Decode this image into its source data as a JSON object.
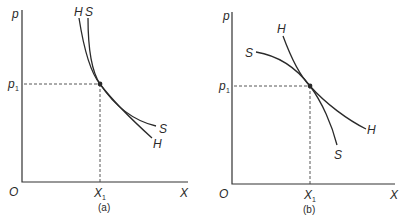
{
  "panels": [
    {
      "id": "a",
      "caption": "(a)",
      "y_axis_label": "p",
      "x_axis_label": "X",
      "origin_label": "O",
      "price_label": "p",
      "price_sub": "1",
      "quantity_label": "X",
      "quantity_sub": "1",
      "curves": [
        {
          "name": "H",
          "start_label": "H",
          "end_label": "H"
        },
        {
          "name": "S",
          "start_label": "S",
          "end_label": "S"
        }
      ]
    },
    {
      "id": "b",
      "caption": "(b)",
      "y_axis_label": "p",
      "x_axis_label": "X",
      "origin_label": "O",
      "price_label": "p",
      "price_sub": "1",
      "quantity_label": "X",
      "quantity_sub": "1",
      "curves": [
        {
          "name": "H",
          "start_label": "H",
          "end_label": "H"
        },
        {
          "name": "S",
          "start_label": "S",
          "end_label": "S"
        }
      ]
    }
  ]
}
